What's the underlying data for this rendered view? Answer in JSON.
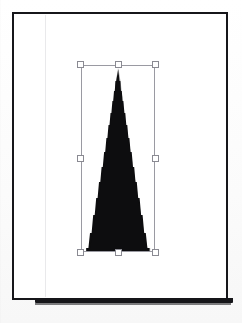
{
  "app": {
    "title": "Canvas",
    "background_color": "#fdfdfd"
  },
  "document": {
    "name": "page",
    "background_color": "#ffffff",
    "border_color": "#16161a",
    "x": 12,
    "y": 12,
    "width": 216,
    "height": 288,
    "guides": [
      {
        "name": "left-margin-guide",
        "orientation": "vertical",
        "x": 45,
        "color": "#78788029"
      }
    ]
  },
  "selection": {
    "label": "",
    "x": 81,
    "y": 65,
    "width": 74,
    "height": 187,
    "outline_color": "#9a9aa2",
    "handle_fill": "#ffffff",
    "handle_border": "#8a8a92",
    "handles": [
      {
        "name": "handle-nw",
        "position": "top-left"
      },
      {
        "name": "handle-n",
        "position": "top-center"
      },
      {
        "name": "handle-ne",
        "position": "top-right"
      },
      {
        "name": "handle-w",
        "position": "middle-left"
      },
      {
        "name": "handle-e",
        "position": "middle-right"
      },
      {
        "name": "handle-sw",
        "position": "bottom-left"
      },
      {
        "name": "handle-s",
        "position": "bottom-center"
      },
      {
        "name": "handle-se",
        "position": "bottom-right"
      }
    ]
  },
  "shape": {
    "name": "spire-triangle",
    "type": "triangle",
    "fill_color": "#0d0d0f",
    "apex_x": 37,
    "apex_y": 5,
    "base_left_x": 5,
    "base_right_x": 69,
    "base_y": 187,
    "edge_style": "aliased-stepped"
  }
}
